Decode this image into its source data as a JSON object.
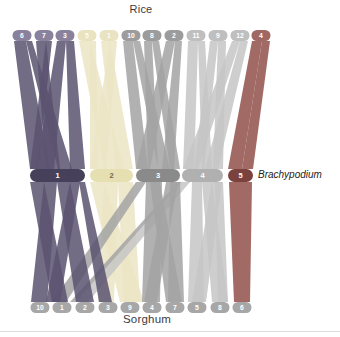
{
  "figure": {
    "background": "#ffffff",
    "labels": {
      "top": "Rice",
      "middle": "Brachypodium",
      "bottom": "Sorghum"
    },
    "groups": {
      "bd1": {
        "ribbon": "#5a5270",
        "rice_pill": "#8a829c",
        "rice_text": "#ffffff",
        "bd_pill": "#46405a",
        "bd_text": "#ffffff"
      },
      "bd2": {
        "ribbon": "#ebe5c4",
        "rice_pill": "#e9e3c2",
        "rice_text": "#fdfcf4",
        "bd_pill": "#e6dfb2",
        "bd_text": "#6f6a52"
      },
      "bd3": {
        "ribbon": "#a3a3a3",
        "rice_pill": "#9c9c9c",
        "rice_text": "#ffffff",
        "bd_pill": "#8a8a8a",
        "bd_text": "#ffffff"
      },
      "bd4": {
        "ribbon": "#c5c5c5",
        "rice_pill": "#bfbfbf",
        "rice_text": "#ffffff",
        "bd_pill": "#b0b0b0",
        "bd_text": "#ffffff"
      },
      "bd5": {
        "ribbon": "#90504a",
        "rice_pill": "#a06862",
        "rice_text": "#ffffff",
        "bd_pill": "#7b413c",
        "bd_text": "#ffffff"
      }
    },
    "rice": {
      "y": 30,
      "h": 11,
      "w": 19,
      "chromosomes": [
        {
          "n": "6",
          "x": 22,
          "g": "bd1"
        },
        {
          "n": "7",
          "x": 44,
          "g": "bd1"
        },
        {
          "n": "3",
          "x": 65,
          "g": "bd1"
        },
        {
          "n": "5",
          "x": 87,
          "g": "bd2"
        },
        {
          "n": "1",
          "x": 109,
          "g": "bd2"
        },
        {
          "n": "10",
          "x": 131,
          "g": "bd3"
        },
        {
          "n": "8",
          "x": 152,
          "g": "bd3"
        },
        {
          "n": "2",
          "x": 174,
          "g": "bd3"
        },
        {
          "n": "11",
          "x": 196,
          "g": "bd4"
        },
        {
          "n": "9",
          "x": 218,
          "g": "bd4"
        },
        {
          "n": "12",
          "x": 240,
          "g": "bd4"
        },
        {
          "n": "4",
          "x": 261,
          "g": "bd5"
        }
      ]
    },
    "brachypodium": {
      "y": 169,
      "h": 13,
      "chromosomes": [
        {
          "n": "1",
          "x1": 30,
          "x2": 85,
          "g": "bd1"
        },
        {
          "n": "2",
          "x1": 90,
          "x2": 133,
          "g": "bd2"
        },
        {
          "n": "3",
          "x1": 136,
          "x2": 180,
          "g": "bd3"
        },
        {
          "n": "4",
          "x1": 182,
          "x2": 223,
          "g": "bd4"
        },
        {
          "n": "5",
          "x1": 228,
          "x2": 253,
          "g": "bd5"
        }
      ]
    },
    "sorghum": {
      "y": 302,
      "h": 11,
      "w": 19,
      "pill": "#a7a7a7",
      "text": "#ffffff",
      "chromosomes": [
        {
          "n": "10",
          "x": 40
        },
        {
          "n": "1",
          "x": 62
        },
        {
          "n": "2",
          "x": 85
        },
        {
          "n": "3",
          "x": 108
        },
        {
          "n": "9",
          "x": 130
        },
        {
          "n": "4",
          "x": 152
        },
        {
          "n": "7",
          "x": 175
        },
        {
          "n": "5",
          "x": 197
        },
        {
          "n": "8",
          "x": 220
        },
        {
          "n": "6",
          "x": 242
        }
      ]
    },
    "synteny_summary": {
      "bd1": {
        "rice": [
          "6",
          "7",
          "3"
        ],
        "sorghum": [
          "10",
          "1",
          "2",
          "3"
        ]
      },
      "bd2": {
        "rice": [
          "5",
          "1"
        ],
        "sorghum": [
          "3",
          "9"
        ]
      },
      "bd3": {
        "rice": [
          "10",
          "8",
          "2"
        ],
        "sorghum": [
          "1",
          "4",
          "7"
        ]
      },
      "bd4": {
        "rice": [
          "11",
          "9",
          "12"
        ],
        "sorghum": [
          "2",
          "5",
          "8"
        ]
      },
      "bd5": {
        "rice": [
          "4"
        ],
        "sorghum": [
          "6"
        ]
      }
    },
    "ribbons": {
      "opacity": 0.85,
      "order": [
        "bd2",
        "bd4",
        "bd3",
        "bd1",
        "bd5"
      ],
      "upper": {
        "y1": 41,
        "y2": 169,
        "bands": [
          {
            "g": "bd1",
            "t": [
              14,
              26
            ],
            "b": [
              30,
              50
            ]
          },
          {
            "g": "bd1",
            "t": [
              26,
              32
            ],
            "b": [
              58,
              72
            ]
          },
          {
            "g": "bd1",
            "t": [
              36,
              46
            ],
            "b": [
              46,
              60
            ]
          },
          {
            "g": "bd1",
            "t": [
              46,
              52
            ],
            "b": [
              30,
              38
            ]
          },
          {
            "g": "bd1",
            "t": [
              57,
              66
            ],
            "b": [
              36,
              54
            ]
          },
          {
            "g": "bd1",
            "t": [
              66,
              74
            ],
            "b": [
              70,
              85
            ]
          },
          {
            "g": "bd2",
            "t": [
              79,
              90
            ],
            "b": [
              104,
              124
            ]
          },
          {
            "g": "bd2",
            "t": [
              90,
              96
            ],
            "b": [
              90,
              98
            ]
          },
          {
            "g": "bd2",
            "t": [
              101,
              110
            ],
            "b": [
              116,
              133
            ]
          },
          {
            "g": "bd2",
            "t": [
              110,
              117
            ],
            "b": [
              90,
              106
            ]
          },
          {
            "g": "bd3",
            "t": [
              123,
              133
            ],
            "b": [
              136,
              148
            ]
          },
          {
            "g": "bd3",
            "t": [
              133,
              140
            ],
            "b": [
              158,
              170
            ]
          },
          {
            "g": "bd3",
            "t": [
              144,
              152
            ],
            "b": [
              148,
              158
            ]
          },
          {
            "g": "bd3",
            "t": [
              152,
              159
            ],
            "b": [
              170,
              180
            ]
          },
          {
            "g": "bd3",
            "t": [
              166,
              175
            ],
            "b": [
              136,
              150
            ]
          },
          {
            "g": "bd3",
            "t": [
              175,
              182
            ],
            "b": [
              162,
              174
            ]
          },
          {
            "g": "bd4",
            "t": [
              188,
              198
            ],
            "b": [
              183,
              194
            ]
          },
          {
            "g": "bd4",
            "t": [
              198,
              205
            ],
            "b": [
              202,
              212
            ]
          },
          {
            "g": "bd4",
            "t": [
              210,
              218
            ],
            "b": [
              194,
              204
            ]
          },
          {
            "g": "bd4",
            "t": [
              218,
              226
            ],
            "b": [
              213,
              223
            ]
          },
          {
            "g": "bd4",
            "t": [
              232,
              240
            ],
            "b": [
              183,
              198
            ]
          },
          {
            "g": "bd4",
            "t": [
              240,
              248
            ],
            "b": [
              205,
              218
            ]
          },
          {
            "g": "bd5",
            "t": [
              252,
              262
            ],
            "b": [
              228,
              242
            ]
          },
          {
            "g": "bd5",
            "t": [
              262,
              270
            ],
            "b": [
              242,
              253
            ]
          }
        ]
      },
      "lower": {
        "y1": 182,
        "y2": 302,
        "bands": [
          {
            "g": "bd1",
            "t": [
              30,
              44
            ],
            "b": [
              52,
              68
            ]
          },
          {
            "g": "bd1",
            "t": [
              44,
              57
            ],
            "b": [
              31,
              47
            ]
          },
          {
            "g": "bd1",
            "t": [
              57,
              70
            ],
            "b": [
              76,
              94
            ]
          },
          {
            "g": "bd1",
            "t": [
              70,
              80
            ],
            "b": [
              46,
              60
            ]
          },
          {
            "g": "bd1",
            "t": [
              79,
              85
            ],
            "b": [
              99,
              112
            ]
          },
          {
            "g": "bd2",
            "t": [
              90,
              104
            ],
            "b": [
              120,
              144
            ]
          },
          {
            "g": "bd2",
            "t": [
              104,
              118
            ],
            "b": [
              98,
              114
            ]
          },
          {
            "g": "bd2",
            "t": [
              118,
              133
            ],
            "b": [
              124,
              140
            ]
          },
          {
            "g": "bd3",
            "t": [
              136,
              146
            ],
            "b": [
              52,
              66
            ]
          },
          {
            "g": "bd3",
            "t": [
              146,
              162
            ],
            "b": [
              142,
              160
            ]
          },
          {
            "g": "bd3",
            "t": [
              150,
              160
            ],
            "b": [
              166,
              182
            ]
          },
          {
            "g": "bd3",
            "t": [
              166,
              178
            ],
            "b": [
              144,
              157
            ]
          },
          {
            "g": "bd3",
            "t": [
              170,
              180
            ],
            "b": [
              168,
              184
            ]
          },
          {
            "g": "bd3",
            "t": [
              178,
              182
            ],
            "b": [
              70,
              76
            ]
          },
          {
            "g": "bd4",
            "t": [
              182,
              190
            ],
            "b": [
              76,
              88
            ]
          },
          {
            "g": "bd4",
            "t": [
              192,
              202
            ],
            "b": [
              188,
              204
            ]
          },
          {
            "g": "bd4",
            "t": [
              202,
              212
            ],
            "b": [
              212,
              228
            ]
          },
          {
            "g": "bd4",
            "t": [
              212,
              222
            ],
            "b": [
              192,
              206
            ]
          },
          {
            "g": "bd4",
            "t": [
              215,
              223
            ],
            "b": [
              218,
              228
            ]
          },
          {
            "g": "bd5",
            "t": [
              229,
              252
            ],
            "b": [
              234,
              250
            ]
          }
        ]
      }
    }
  }
}
